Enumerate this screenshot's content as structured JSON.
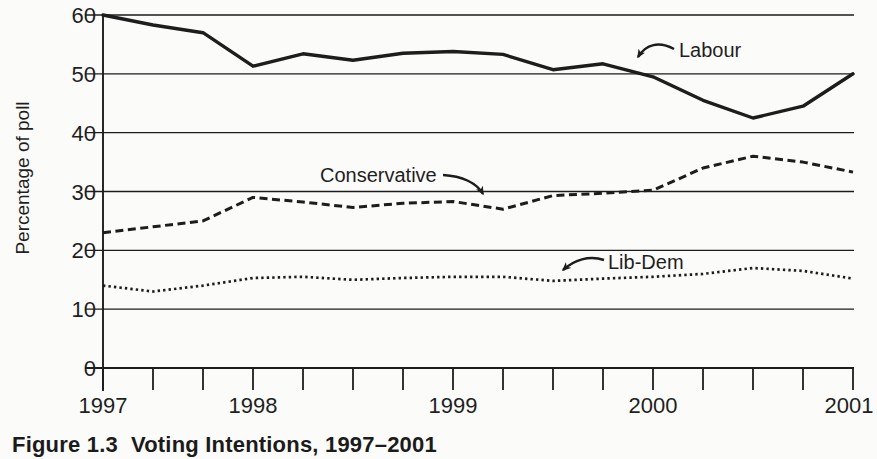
{
  "figure": {
    "caption_label": "Figure 1.3",
    "caption_title": "Voting Intentions, 1997–2001"
  },
  "chart_data": {
    "type": "line",
    "title": "",
    "xlabel": "",
    "ylabel": "Percentage of poll",
    "ylim": [
      0,
      60
    ],
    "xlim": [
      1997.25,
      2001
    ],
    "grid": "horizontal",
    "legend_position": "inline-annotations",
    "y_ticks": [
      0,
      10,
      20,
      30,
      40,
      50,
      60
    ],
    "x_minor_tick_interval_years": 0.25,
    "x_year_labels": [
      "1997",
      "1998",
      "1999",
      "2000",
      "2001"
    ],
    "x_year_label_positions": [
      1997.25,
      1998,
      1999,
      2000,
      2001
    ],
    "x": [
      1997.25,
      1997.5,
      1997.75,
      1998,
      1998.25,
      1998.5,
      1998.75,
      1999,
      1999.25,
      1999.5,
      1999.75,
      2000,
      2000.25,
      2000.5,
      2000.75,
      2001
    ],
    "series": [
      {
        "name": "Labour",
        "style": "solid",
        "values": [
          60,
          58.3,
          57,
          51.3,
          53.4,
          52.3,
          53.5,
          53.8,
          53.3,
          50.7,
          51.7,
          49.5,
          45.5,
          42.5,
          44.5,
          50
        ]
      },
      {
        "name": "Conservative",
        "style": "dashed",
        "values": [
          23,
          24,
          25,
          29,
          28.2,
          27.3,
          28,
          28.3,
          27,
          29.3,
          29.7,
          30.2,
          34,
          36,
          35,
          33.3
        ]
      },
      {
        "name": "Lib-Dem",
        "style": "dotted",
        "values": [
          14,
          13,
          14,
          15.3,
          15.5,
          15,
          15.3,
          15.5,
          15.5,
          14.8,
          15.2,
          15.5,
          16,
          17,
          16.5,
          15.2
        ]
      }
    ],
    "annotations": [
      {
        "text": "Labour",
        "points_to": "Labour line near 2000"
      },
      {
        "text": "Conservative",
        "points_to": "Conservative line near mid-1999"
      },
      {
        "text": "Lib-Dem",
        "points_to": "Lib-Dem line near late 1999"
      }
    ],
    "ink_color": "#1d1d1d",
    "background_color": "#fbfbf9"
  }
}
